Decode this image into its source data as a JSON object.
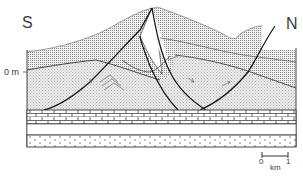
{
  "figure": {
    "type": "geological cross-section",
    "orientation": {
      "left_label": "S",
      "right_label": "N"
    },
    "datum_label": "0 m",
    "scale_bar": {
      "start": "0",
      "end": "1",
      "unit": "km"
    },
    "units": [
      {
        "name": "upper-overburden",
        "pattern": "dense-grid",
        "color": "#b8b8b8"
      },
      {
        "name": "deformed-stippled-unit",
        "pattern": "fine-stipple",
        "color": "#dcdcdc"
      },
      {
        "name": "limestone-layer",
        "pattern": "brick",
        "color": "#ffffff"
      },
      {
        "name": "blank-layer",
        "pattern": "none",
        "color": "#ffffff"
      },
      {
        "name": "sandstone-layer",
        "pattern": "dots",
        "color": "#ffffff"
      }
    ],
    "structures": [
      "thrust-fault-south",
      "thrust-fault-central",
      "thrust-fault-north",
      "fold-chevrons",
      "shear-sense-arrows"
    ]
  }
}
